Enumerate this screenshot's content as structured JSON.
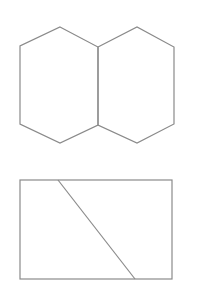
{
  "figure": {
    "width": 198,
    "height": 297,
    "stroke_color": "#8a8a8a",
    "background": "#ffffff",
    "shapes": [
      {
        "name": "two-fused-hexagons",
        "left_hexagon": [
          [
            60,
            27
          ],
          [
            98,
            47
          ],
          [
            98,
            125
          ],
          [
            60,
            143
          ],
          [
            20,
            124
          ],
          [
            20,
            46
          ]
        ],
        "right_hexagon": [
          [
            98,
            47
          ],
          [
            137,
            27
          ],
          [
            174,
            47
          ],
          [
            174,
            124
          ],
          [
            137,
            143
          ],
          [
            98,
            125
          ]
        ]
      },
      {
        "name": "rectangle-with-diagonal",
        "rect": {
          "x": 20,
          "y": 180,
          "width": 152,
          "height": 99
        },
        "diagonal": [
          [
            58,
            180
          ],
          [
            135,
            279
          ]
        ]
      }
    ]
  }
}
